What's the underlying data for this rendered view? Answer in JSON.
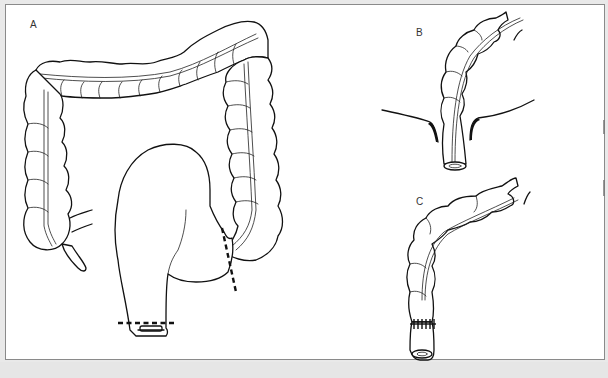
{
  "figure": {
    "type": "surgical-illustration",
    "panels": [
      {
        "id": "A",
        "label": "A",
        "description": "Full colon with dilated rectosigmoid; dashed resection lines across proximal sigmoid and distal rectum"
      },
      {
        "id": "B",
        "label": "B",
        "description": "Colon pulled through the anal canal / pelvic floor"
      },
      {
        "id": "C",
        "label": "C",
        "description": "Completed colo-anal anastomosis with sutures"
      }
    ],
    "colors": {
      "line": "#111111",
      "background": "#ffffff",
      "frame": "#8a8a8a"
    }
  }
}
